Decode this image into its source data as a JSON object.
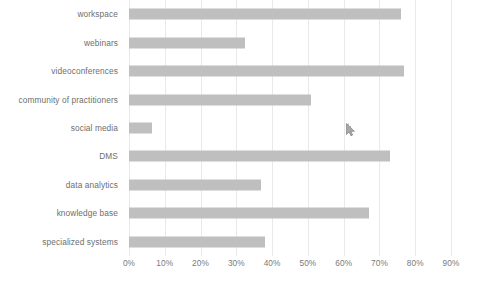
{
  "chart_data": {
    "type": "bar",
    "orientation": "horizontal",
    "title": "",
    "xlabel": "",
    "ylabel": "",
    "categories": [
      "workspace",
      "webinars",
      "videoconferences",
      "community of practitioners",
      "social media",
      "DMS",
      "data analytics",
      "knowledge base",
      "specialized systems"
    ],
    "values": [
      76,
      32.5,
      77,
      51,
      6.5,
      73,
      37,
      67,
      38
    ],
    "value_unit": "%",
    "xlim": [
      0,
      90
    ],
    "xticks": [
      0,
      10,
      20,
      30,
      40,
      50,
      60,
      70,
      80,
      90
    ],
    "xtick_labels": [
      "0%",
      "10%",
      "20%",
      "30%",
      "40%",
      "50%",
      "60%",
      "70%",
      "80%",
      "90%"
    ],
    "grid": true,
    "grid_axis": "x",
    "legend": false,
    "bar_color": "#bfbfbf",
    "grid_color": "#e9e9e9",
    "label_color": "#6e6e6e",
    "background_color": "#ffffff"
  },
  "cursor": {
    "name": "mouse-pointer-artifact",
    "x_percent": 60,
    "visible": true
  }
}
